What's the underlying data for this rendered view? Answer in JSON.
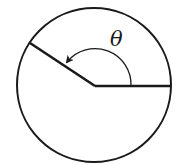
{
  "diagram": {
    "type": "angle-in-circle",
    "angle_label": "θ",
    "angle_direction": "counterclockwise",
    "colors": {
      "stroke": "#1a1a1a",
      "background": "#ffffff"
    },
    "circle": {
      "center_x": 94,
      "center_y": 85,
      "radius": 77
    },
    "vertex": {
      "x": 95,
      "y": 86
    },
    "initial_side_end": {
      "x": 171,
      "y": 86
    },
    "terminal_side_end": {
      "x": 30,
      "y": 43
    },
    "angle_arc_radius": 36
  }
}
